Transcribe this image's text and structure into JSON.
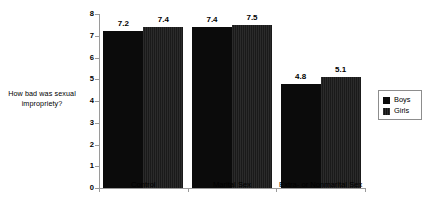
{
  "chart_data": {
    "type": "bar",
    "title": "",
    "subtitle": "",
    "xlabel": "",
    "ylabel": "How bad was sexual impropriety?",
    "ylabel_line1": "How bad was sexual",
    "ylabel_line2": "impropriety?",
    "categories": [
      "Control",
      "Marital Sex",
      "Extra- or Nonmarital Sex"
    ],
    "series": [
      {
        "name": "Boys",
        "color": "#0b0b0b",
        "values": [
          7.2,
          7.4,
          4.8
        ]
      },
      {
        "name": "Girls",
        "color": "#232323",
        "values": [
          7.4,
          7.5,
          5.1
        ]
      }
    ],
    "value_labels": {
      "boys": [
        "7.2",
        "7.4",
        "4.8"
      ],
      "girls": [
        "7.4",
        "7.5",
        "5.1"
      ]
    },
    "ylim": [
      0,
      8
    ],
    "yticks": [
      0,
      1,
      2,
      3,
      4,
      5,
      6,
      7,
      8
    ],
    "ytick_labels": [
      "0",
      "1",
      "2",
      "3",
      "4",
      "5",
      "6",
      "7",
      "8"
    ],
    "grid": false,
    "legend_position": "right",
    "legend_entries": [
      "Boys",
      "Girls"
    ]
  },
  "legend": {
    "items": [
      {
        "label": "Boys"
      },
      {
        "label": "Girls"
      }
    ]
  }
}
